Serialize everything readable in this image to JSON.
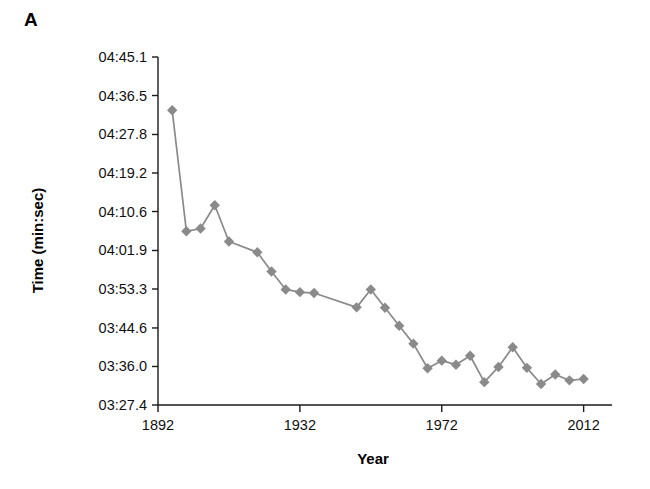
{
  "panel": {
    "label": "A"
  },
  "chart_data": {
    "type": "line",
    "title": "",
    "subtitle": "",
    "xlabel": "Year",
    "ylabel": "Time (min:sec)",
    "xlim": [
      1892,
      2020
    ],
    "ylim": [
      "03:27.4",
      "04:45.1"
    ],
    "ylim_seconds": [
      207.4,
      285.1
    ],
    "grid": false,
    "legend": null,
    "marker": "diamond",
    "series_color": "#8a8a8a",
    "xticks": [
      "1892",
      "1932",
      "1972",
      "2012"
    ],
    "xtick_values": [
      1892,
      1932,
      1972,
      2012
    ],
    "yticks": [
      "04:45.1",
      "04:36.5",
      "04:27.8",
      "04:19.2",
      "04:10.6",
      "04:01.9",
      "03:53.3",
      "03:44.6",
      "03:36.0",
      "03:27.4"
    ],
    "ytick_seconds": [
      285.1,
      276.5,
      267.8,
      259.2,
      250.6,
      241.9,
      233.3,
      224.6,
      216.0,
      207.4
    ],
    "series": [
      {
        "name": "Winning time",
        "x": [
          1896,
          1900,
          1904,
          1908,
          1912,
          1920,
          1924,
          1928,
          1932,
          1936,
          1948,
          1952,
          1956,
          1960,
          1964,
          1968,
          1972,
          1976,
          1980,
          1984,
          1988,
          1992,
          1996,
          2000,
          2004,
          2008,
          2012
        ],
        "y_labels": [
          "04:33.2",
          "04:06.2",
          "04:06.8",
          "04:12.0",
          "04:03.9",
          "04:01.5",
          "03:57.2",
          "03:53.2",
          "03:52.6",
          "03:52.4",
          "03:49.2",
          "03:53.2",
          "03:49.1",
          "03:45.1",
          "03:41.1",
          "03:35.6",
          "03:37.3",
          "03:36.4",
          "03:38.4",
          "03:32.5",
          "03:35.9",
          "03:40.3",
          "03:35.7",
          "03:32.1",
          "03:34.2",
          "03:32.9",
          "03:33.2"
        ],
        "y_seconds": [
          273.2,
          246.2,
          246.8,
          252.0,
          243.9,
          241.5,
          237.2,
          233.2,
          232.6,
          232.4,
          229.2,
          233.2,
          229.1,
          225.1,
          221.1,
          215.6,
          217.3,
          216.4,
          218.4,
          212.5,
          215.9,
          220.3,
          215.7,
          212.1,
          214.2,
          212.9,
          213.2
        ]
      }
    ]
  }
}
